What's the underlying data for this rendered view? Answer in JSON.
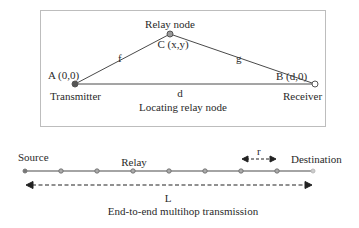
{
  "top_panel": {
    "caption": "Locating relay node",
    "relay": {
      "title": "Relay node",
      "label": "C (x,y)"
    },
    "transmitter": {
      "label": "A (0,0)",
      "role": "Transmitter"
    },
    "receiver": {
      "label": "B (d,0)",
      "role": "Receiver"
    },
    "edges": {
      "ac": "f",
      "cb": "g",
      "ab": "d"
    }
  },
  "bottom_panel": {
    "caption": "End-to-end multihop transmission",
    "source_label": "Source",
    "relay_label": "Relay",
    "destination_label": "Destination",
    "hop_distance_label": "r",
    "total_distance_label": "L",
    "relay_count": 7
  },
  "colors": {
    "line": "#4a4a4a",
    "node_fill": "#9a9a9a",
    "border": "#bdbdbd"
  }
}
